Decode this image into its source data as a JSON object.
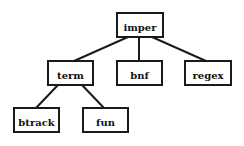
{
  "diagram": {
    "type": "tree",
    "nodes": {
      "imper": {
        "label": "imper"
      },
      "term": {
        "label": "term"
      },
      "bnf": {
        "label": "bnf"
      },
      "regex": {
        "label": "regex"
      },
      "btrack": {
        "label": "btrack"
      },
      "fun": {
        "label": "fun"
      }
    },
    "edges": [
      {
        "from": "imper",
        "to": "term"
      },
      {
        "from": "imper",
        "to": "bnf"
      },
      {
        "from": "imper",
        "to": "regex"
      },
      {
        "from": "term",
        "to": "btrack"
      },
      {
        "from": "term",
        "to": "fun"
      }
    ]
  }
}
